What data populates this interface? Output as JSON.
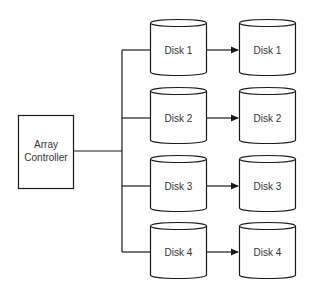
{
  "diagram": {
    "controller": {
      "line1": "Array",
      "line2": "Controller"
    },
    "left_disks": [
      {
        "label": "Disk 1"
      },
      {
        "label": "Disk 2"
      },
      {
        "label": "Disk 3"
      },
      {
        "label": "Disk 4"
      }
    ],
    "right_disks": [
      {
        "label": "Disk 1"
      },
      {
        "label": "Disk 2"
      },
      {
        "label": "Disk 3"
      },
      {
        "label": "Disk 4"
      }
    ]
  },
  "colors": {
    "stroke": "#1a1a1a",
    "text": "#333333",
    "background": "#ffffff"
  }
}
